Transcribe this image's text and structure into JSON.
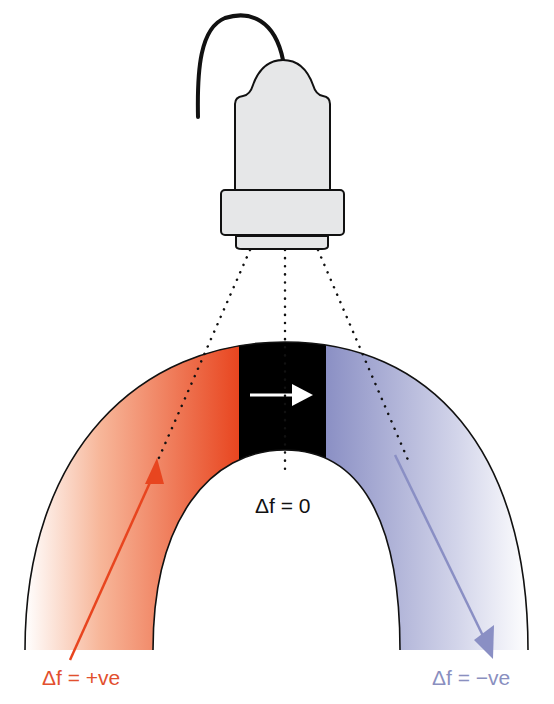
{
  "diagram": {
    "colors": {
      "toward": "#e8451f",
      "away": "#8a8fc4",
      "center_band": "#000000",
      "probe_fill": "#e6e7e8",
      "outline": "#111111"
    },
    "labels": {
      "zero": "Δf = 0",
      "positive": "Δf = +ve",
      "negative": "Δf = −ve"
    },
    "elements": [
      "probe",
      "cable",
      "beam-lines",
      "vessel-arch",
      "flow-arrow",
      "toward-arrow",
      "away-arrow"
    ]
  }
}
